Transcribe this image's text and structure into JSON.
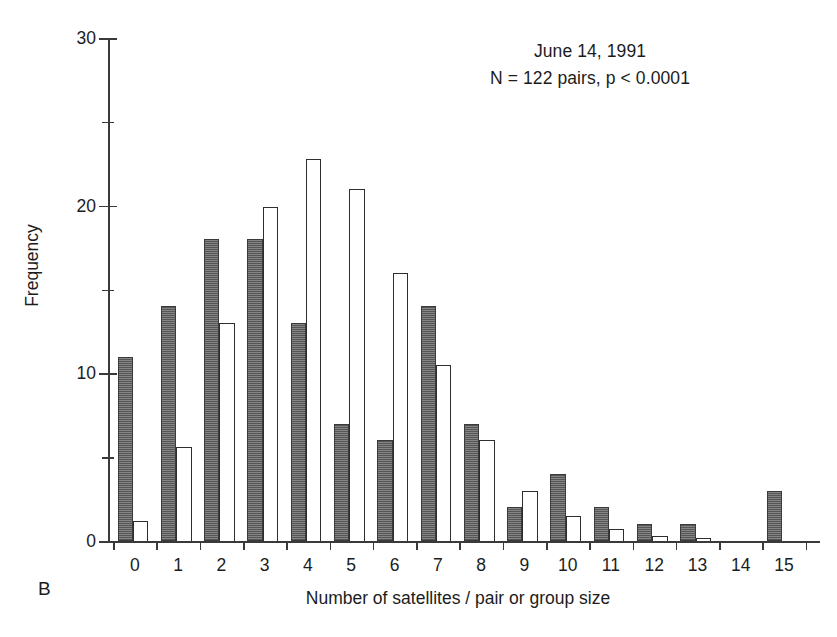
{
  "panel": {
    "label": "B"
  },
  "annotation": {
    "line1": "June 14, 1991",
    "line2": "N = 122 pairs, p < 0.0001"
  },
  "axes": {
    "xlabel": "Number of satellites / pair or group size",
    "ylabel": "Frequency"
  },
  "chart_data": {
    "type": "bar",
    "title": "",
    "subtitle": "June 14, 1991",
    "annotations": [
      "June 14, 1991",
      "N = 122 pairs, p < 0.0001",
      "B"
    ],
    "xlabel": "Number of satellites / pair or group size",
    "ylabel": "Frequency",
    "categories": [
      0,
      1,
      2,
      3,
      4,
      5,
      6,
      7,
      8,
      9,
      10,
      11,
      12,
      13,
      14,
      15
    ],
    "xtick_labels": [
      "0",
      "1",
      "2",
      "3",
      "4",
      "5",
      "6",
      "7",
      "8",
      "9",
      "10",
      "11",
      "12",
      "13",
      "14",
      "15"
    ],
    "ytick_labels": [
      "0",
      "10",
      "20",
      "30"
    ],
    "ytick_values": [
      0,
      10,
      20,
      30
    ],
    "yminor_ticks": [
      5,
      15,
      25
    ],
    "ylim": [
      0,
      30
    ],
    "xlim": [
      -0.5,
      15.5
    ],
    "grid": false,
    "legend": "none",
    "series": [
      {
        "name": "observed",
        "style": "filled-dark-gray",
        "color": "#6e6e6e",
        "values": [
          11,
          14,
          18,
          18,
          13,
          7,
          6,
          14,
          7,
          2,
          4,
          2,
          1,
          1,
          0,
          3
        ]
      },
      {
        "name": "expected",
        "style": "open-white",
        "color": "#ffffff",
        "values": [
          1.2,
          5.6,
          13,
          19.9,
          22.8,
          21,
          16,
          10.5,
          6,
          3,
          1.5,
          0.7,
          0.3,
          0.2,
          0,
          0
        ]
      }
    ]
  }
}
